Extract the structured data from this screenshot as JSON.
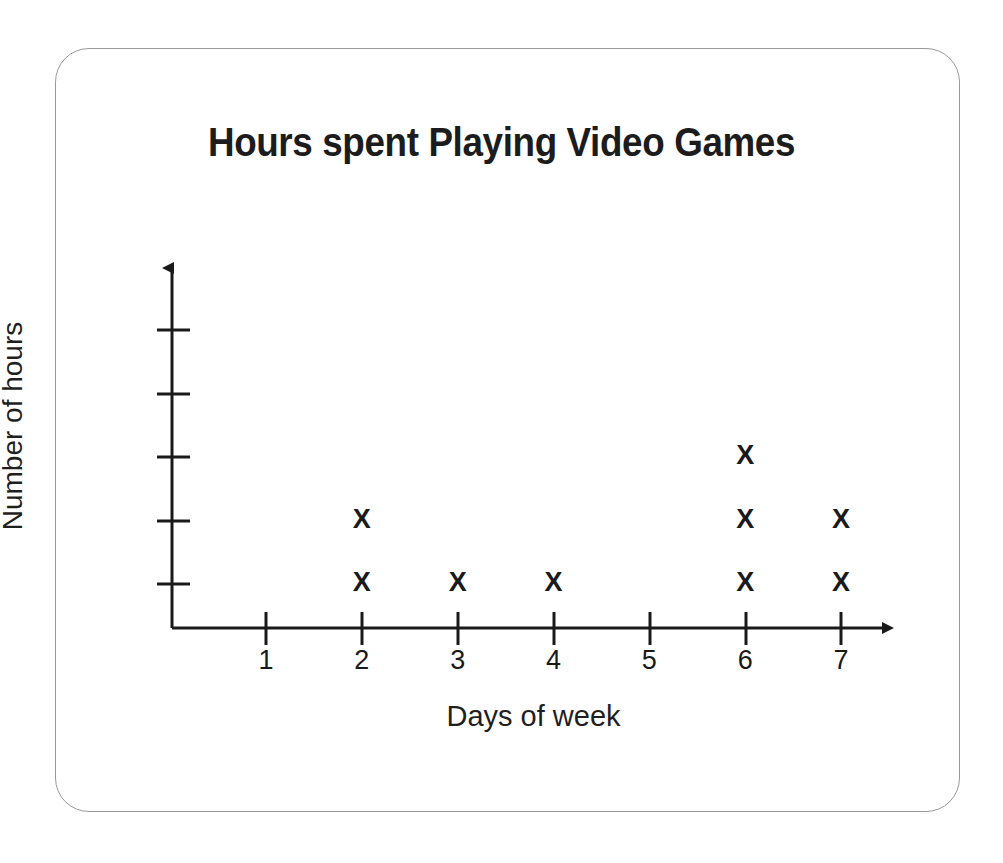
{
  "card": {
    "border_color": "#9a9a9a",
    "background": "#ffffff"
  },
  "chart_data": {
    "type": "scatter",
    "plot_style": "dot-plot-x-marks",
    "title": "Hours spent Playing Video Games",
    "xlabel": "Days of week",
    "ylabel": "Number of hours",
    "marker": "X",
    "marker_color": "#1a1a1a",
    "axis_color": "#1a1a1a",
    "grid": false,
    "legend": null,
    "x": [
      1,
      2,
      3,
      4,
      5,
      6,
      7
    ],
    "xtick_labels": [
      "1",
      "2",
      "3",
      "4",
      "5",
      "6",
      "7"
    ],
    "ytick_labels": [
      "",
      "",
      "",
      "",
      ""
    ],
    "ytick_values": [
      1,
      2,
      3,
      4,
      5
    ],
    "xlim": [
      0,
      7.6
    ],
    "ylim": [
      0,
      5.6
    ],
    "values": [
      0,
      2,
      1,
      1,
      0,
      3,
      2
    ],
    "categories": [
      "1",
      "2",
      "3",
      "4",
      "5",
      "6",
      "7"
    ],
    "points": [
      {
        "x": 2,
        "y": 1
      },
      {
        "x": 2,
        "y": 2
      },
      {
        "x": 3,
        "y": 1
      },
      {
        "x": 4,
        "y": 1
      },
      {
        "x": 6,
        "y": 1
      },
      {
        "x": 6,
        "y": 2
      },
      {
        "x": 6,
        "y": 3
      },
      {
        "x": 7,
        "y": 1
      },
      {
        "x": 7,
        "y": 2
      }
    ],
    "annotations": []
  }
}
